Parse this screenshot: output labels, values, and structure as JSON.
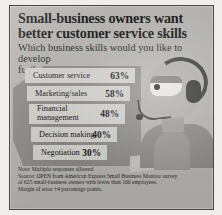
{
  "headline": {
    "line1": "Small-business owners want",
    "line2": "better customer service skills"
  },
  "subtitle": {
    "line1": "Which business skills would you like to develop",
    "line2": "further? Top responses:"
  },
  "chart_data": {
    "type": "bar",
    "title": "Small-business owners want better customer service skills",
    "subtitle": "Which business skills would you like to develop further? Top responses:",
    "categories": [
      "Customer service",
      "Marketing/sales",
      "Financial management",
      "Decision making",
      "Negotiation"
    ],
    "values": [
      63,
      58,
      48,
      40,
      30
    ],
    "value_labels": [
      "63%",
      "58%",
      "48%",
      "40%",
      "30%"
    ],
    "xlabel": "",
    "ylabel": "",
    "ylim": [
      0,
      100
    ],
    "grid": false,
    "legend": false,
    "orientation": "descending-step-pyramid",
    "units": "percent"
  },
  "rows": [
    {
      "label": "Customer service",
      "value": "63%"
    },
    {
      "label": "Marketing/sales",
      "value": "58%"
    },
    {
      "label": "Financial\nmanagement",
      "value": "48%"
    },
    {
      "label": "Decision making",
      "value": "40%"
    },
    {
      "label": "Negotiation",
      "value": "30%"
    }
  ],
  "notes": {
    "line1": "Note: Multiple responses allowed",
    "line2": "Source: OPEN from American Express Small Business Monitor survey",
    "line3": "of 625 small-business owners with fewer than 100 employees.",
    "line4": "Margin of error ±4 percentage points."
  },
  "illustration": {
    "name": "customer-service-agent-with-headset"
  },
  "colors": {
    "panel_background": "#b9b8b4",
    "pyramid": "#8e8d89",
    "step": "#d8d7d3",
    "text": "#161616",
    "border": "#4a4a48"
  }
}
